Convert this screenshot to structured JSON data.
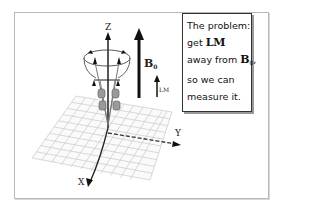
{
  "diagram": {
    "axes": {
      "z": "Z",
      "y": "Y",
      "x": "X"
    },
    "field_label": {
      "main": "B",
      "sub": "0"
    },
    "magnetization_label": "LM",
    "textbox": {
      "line1": "The problem:",
      "line2_prefix": "get ",
      "line2_bold": "LM",
      "line3_prefix": "away from ",
      "line3_bold": "B",
      "line3_sub": "0",
      "line3_suffix": ",",
      "line4": "so we can",
      "line5": "measure it."
    }
  }
}
